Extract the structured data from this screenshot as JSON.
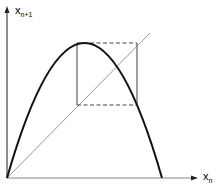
{
  "diagram": {
    "type": "cobweb-plot",
    "axes": {
      "y_label": {
        "base": "x",
        "sub": "n+1"
      },
      "x_label": {
        "base": "x",
        "sub": "n"
      }
    },
    "elements": [
      "axes with arrows",
      "parabola (logistic map curve)",
      "diagonal line y = x",
      "cobweb cycle (period-2 box, dashed horizontals)"
    ],
    "colors": {
      "curve": "#111111",
      "axes": "#444444",
      "diagonal": "#999999",
      "cobweb": "#444444"
    }
  }
}
